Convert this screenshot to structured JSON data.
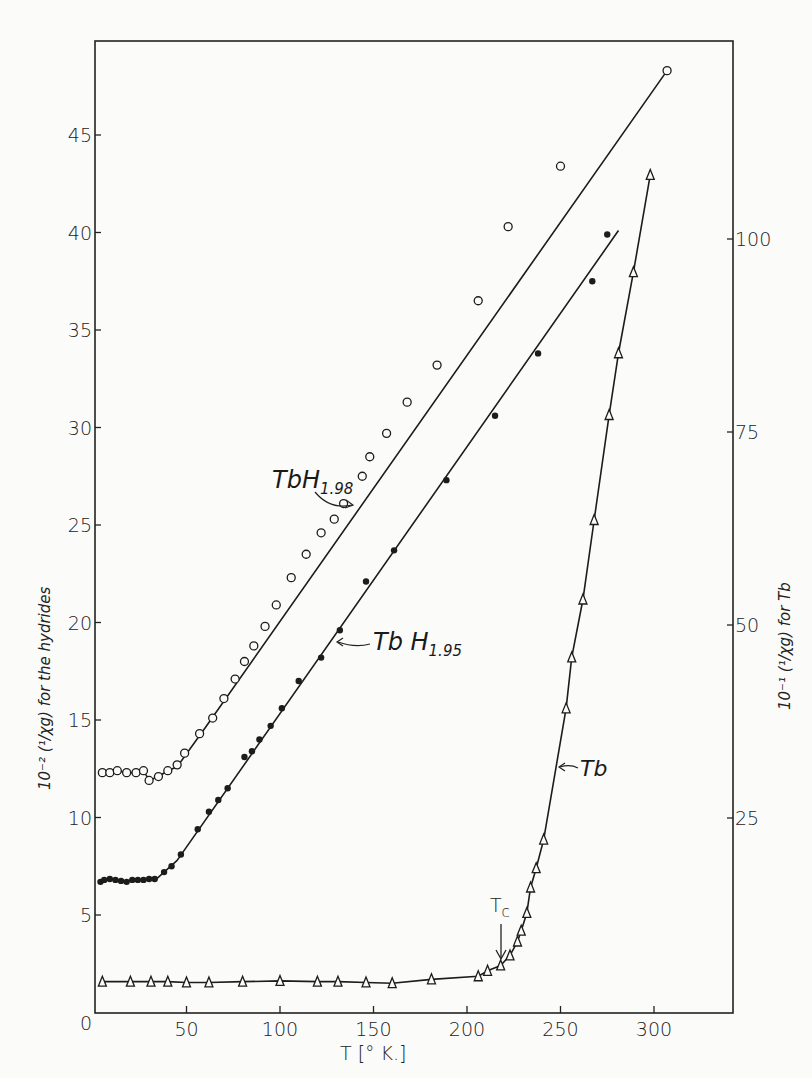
{
  "chart_data": {
    "type": "scatter",
    "title": "",
    "xlabel": "T [°K]",
    "ylabel_left": "10^-2 (1/χg) for the hydrides",
    "ylabel_right": "10^-1 (1/χg) for Tb",
    "xlim": [
      0,
      330
    ],
    "ylim_left": [
      0,
      48
    ],
    "ylim_right": [
      0,
      122
    ],
    "x_ticks": [
      0,
      50,
      100,
      150,
      200,
      250,
      300
    ],
    "y_ticks_left": [
      5,
      10,
      15,
      20,
      25,
      30,
      35,
      40,
      45
    ],
    "y_ticks_right": [
      25,
      50,
      75,
      100
    ],
    "grid": false,
    "legend": "inline labels",
    "annotations": [
      {
        "text": "Tc",
        "x": 218,
        "note": "arrow pointing down to Tb curve at Curie temperature"
      }
    ],
    "series": [
      {
        "name": "TbH1.98",
        "marker": "open-circle",
        "axis": "left",
        "points": [
          [
            5,
            12.3
          ],
          [
            9,
            12.3
          ],
          [
            13,
            12.4
          ],
          [
            18,
            12.3
          ],
          [
            23,
            12.3
          ],
          [
            27,
            12.4
          ],
          [
            30,
            11.9
          ],
          [
            35,
            12.1
          ],
          [
            40,
            12.4
          ],
          [
            45,
            12.7
          ],
          [
            49,
            13.3
          ],
          [
            57,
            14.3
          ],
          [
            64,
            15.1
          ],
          [
            70,
            16.1
          ],
          [
            76,
            17.1
          ],
          [
            81,
            18.0
          ],
          [
            86,
            18.8
          ],
          [
            92,
            19.8
          ],
          [
            98,
            20.9
          ],
          [
            106,
            22.3
          ],
          [
            114,
            23.5
          ],
          [
            122,
            24.6
          ],
          [
            129,
            25.3
          ],
          [
            134,
            26.1
          ],
          [
            144,
            27.5
          ],
          [
            148,
            28.5
          ],
          [
            157,
            29.7
          ],
          [
            168,
            31.3
          ],
          [
            184,
            33.2
          ],
          [
            206,
            36.5
          ],
          [
            222,
            40.3
          ],
          [
            250,
            43.4
          ],
          [
            307,
            48.3
          ]
        ],
        "fit_line": [
          [
            5,
            12.3
          ],
          [
            28,
            12.2
          ],
          [
            45,
            12.6
          ],
          [
            60,
            14.6
          ],
          [
            307,
            48.3
          ]
        ]
      },
      {
        "name": "TbH1.95",
        "marker": "filled-circle",
        "axis": "left",
        "points": [
          [
            4,
            6.7
          ],
          [
            6,
            6.8
          ],
          [
            9,
            6.85
          ],
          [
            12,
            6.8
          ],
          [
            15,
            6.75
          ],
          [
            18,
            6.7
          ],
          [
            21,
            6.8
          ],
          [
            24,
            6.8
          ],
          [
            27,
            6.8
          ],
          [
            30,
            6.85
          ],
          [
            33,
            6.85
          ],
          [
            38,
            7.2
          ],
          [
            42,
            7.5
          ],
          [
            47,
            8.1
          ],
          [
            56,
            9.4
          ],
          [
            62,
            10.3
          ],
          [
            67,
            10.9
          ],
          [
            72,
            11.5
          ],
          [
            81,
            13.1
          ],
          [
            85,
            13.4
          ],
          [
            89,
            14.0
          ],
          [
            95,
            14.7
          ],
          [
            101,
            15.6
          ],
          [
            110,
            17.0
          ],
          [
            122,
            18.2
          ],
          [
            132,
            19.6
          ],
          [
            146,
            22.1
          ],
          [
            161,
            23.7
          ],
          [
            189,
            27.3
          ],
          [
            215,
            30.6
          ],
          [
            238,
            33.8
          ],
          [
            267,
            37.5
          ],
          [
            275,
            39.9
          ]
        ],
        "fit_line": [
          [
            4,
            6.7
          ],
          [
            34,
            6.85
          ],
          [
            45,
            7.8
          ],
          [
            281,
            40.1
          ]
        ]
      },
      {
        "name": "Tb",
        "marker": "open-triangle",
        "axis": "right",
        "points": [
          [
            5,
            3.8
          ],
          [
            20,
            3.8
          ],
          [
            31,
            3.8
          ],
          [
            40,
            3.8
          ],
          [
            50,
            3.7
          ],
          [
            62,
            3.7
          ],
          [
            80,
            3.8
          ],
          [
            100,
            3.9
          ],
          [
            120,
            3.8
          ],
          [
            131,
            3.8
          ],
          [
            146,
            3.7
          ],
          [
            160,
            3.6
          ],
          [
            181,
            4.1
          ],
          [
            206,
            4.5
          ],
          [
            211,
            5.2
          ],
          [
            218,
            5.9
          ],
          [
            223,
            7.2
          ],
          [
            227,
            9.0
          ],
          [
            229,
            10.4
          ],
          [
            232,
            12.7
          ],
          [
            234,
            16.0
          ],
          [
            237,
            18.5
          ],
          [
            241,
            22.2
          ],
          [
            253,
            39.2
          ],
          [
            256,
            45.8
          ],
          [
            262,
            53.3
          ],
          [
            268,
            63.6
          ],
          [
            276,
            77.2
          ],
          [
            281,
            85.2
          ],
          [
            289,
            95.7
          ],
          [
            298,
            108.3
          ]
        ]
      }
    ]
  },
  "labels": {
    "series_1": "TbH",
    "series_1_sub": "1.98",
    "series_2": "Tb H",
    "series_2_sub": "1.95",
    "series_3": "Tb",
    "tc_main": "T",
    "tc_sub": "c",
    "xlabel": "T [° K.]",
    "ylabel_left": "10⁻² (¹/χg)   for  the  hydrides",
    "ylabel_right": "10⁻¹ (¹/χg)   for  Tb",
    "origin": "0"
  }
}
